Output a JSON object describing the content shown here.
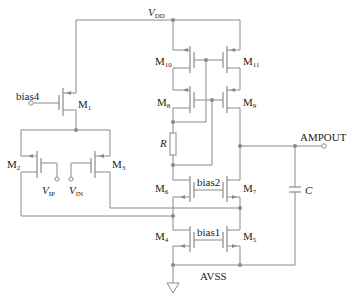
{
  "labels": {
    "vdd": "V",
    "vdd_sub": "DD",
    "avss": "AVSS",
    "ampout": "AMPOUT",
    "bias1": "bias1",
    "bias2": "bias2",
    "bias4": "bias4",
    "vip": "V",
    "vip_sub": "IP",
    "vin": "V",
    "vin_sub": "IN",
    "r": "R",
    "c": "C"
  },
  "transistors": [
    {
      "name": "M",
      "sub": "1"
    },
    {
      "name": "M",
      "sub": "2"
    },
    {
      "name": "M",
      "sub": "3"
    },
    {
      "name": "M",
      "sub": "4"
    },
    {
      "name": "M",
      "sub": "5"
    },
    {
      "name": "M",
      "sub": "6"
    },
    {
      "name": "M",
      "sub": "7"
    },
    {
      "name": "M",
      "sub": "8"
    },
    {
      "name": "M",
      "sub": "9"
    },
    {
      "name": "M",
      "sub": "10"
    },
    {
      "name": "M",
      "sub": "11"
    }
  ],
  "colors": {
    "wire": "#8a8a8a",
    "text": "#222222"
  }
}
